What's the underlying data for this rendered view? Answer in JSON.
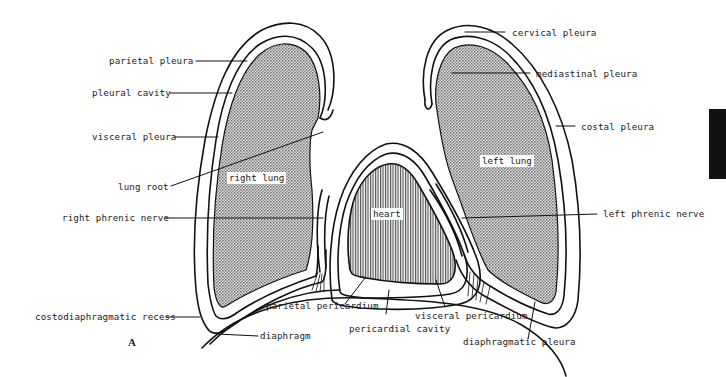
{
  "figure": {
    "panel_letter": "A",
    "colors": {
      "outline": "#111111",
      "lung_fill": "#bdbdbd",
      "heart_fill": "#9a9a9a",
      "background": "#ffffff",
      "edge_tab": "#111111"
    }
  },
  "structures": {
    "right_lung": "right lung",
    "left_lung": "left lung",
    "heart": "heart"
  },
  "labels": {
    "left_side": [
      {
        "id": "parietal-pleura",
        "text": "parietal pleura"
      },
      {
        "id": "pleural-cavity",
        "text": "pleural cavity"
      },
      {
        "id": "visceral-pleura",
        "text": "visceral pleura"
      },
      {
        "id": "lung-root",
        "text": "lung root"
      },
      {
        "id": "right-phrenic-nerve",
        "text": "right phrenic nerve"
      },
      {
        "id": "costodiaphragmatic-recess",
        "text": "costodiaphragmatic recess"
      },
      {
        "id": "diaphragm",
        "text": "diaphragm"
      }
    ],
    "right_side": [
      {
        "id": "cervical-pleura",
        "text": "cervical pleura"
      },
      {
        "id": "mediastinal-pleura",
        "text": "mediastinal pleura"
      },
      {
        "id": "costal-pleura",
        "text": "costal pleura"
      },
      {
        "id": "left-phrenic-nerve",
        "text": "left phrenic nerve"
      }
    ],
    "bottom": [
      {
        "id": "parietal-pericardium",
        "text": "parietal pericardium"
      },
      {
        "id": "pericardial-cavity",
        "text": "pericardial cavity"
      },
      {
        "id": "visceral-pericardium",
        "text": "visceral pericardium"
      },
      {
        "id": "diaphragmatic-pleura",
        "text": "diaphragmatic pleura"
      }
    ]
  }
}
